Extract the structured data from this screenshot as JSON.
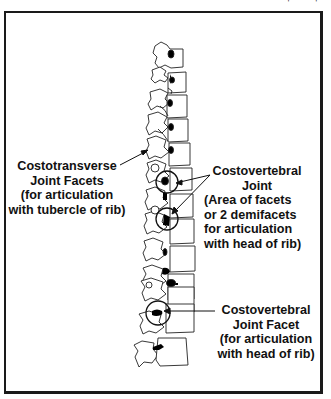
{
  "figure": {
    "type": "anatomical-diagram",
    "colors": {
      "line": "#1a1a1a",
      "background": "#ffffff",
      "facet_fill": "#000000"
    }
  },
  "labels": {
    "costotransverse": {
      "lines": [
        "Costotransverse",
        "Joint Facets",
        "(for articulation",
        "with tubercle of rib)"
      ]
    },
    "costovertebral_joint": {
      "lines": [
        "Costovertebral",
        "Joint",
        "(Area of facets",
        "or 2 demifacets",
        "for articulation",
        "with head of rib)"
      ]
    },
    "costovertebral_facet": {
      "lines": [
        "Costovertebral",
        "Joint Facet",
        "(for articulation",
        "with head of rib)"
      ]
    }
  }
}
